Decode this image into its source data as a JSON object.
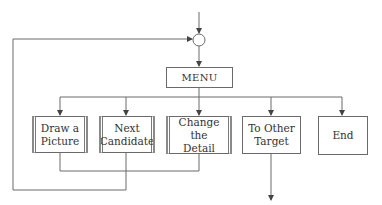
{
  "diagram": {
    "type": "flowchart",
    "nodes": {
      "junction": {
        "shape": "circle"
      },
      "menu": {
        "label": "MENU"
      },
      "draw_picture": {
        "label": "Draw a\nPicture",
        "kind": "subroutine"
      },
      "next_candidate": {
        "label": "Next\nCandidate",
        "kind": "subroutine"
      },
      "change_detail": {
        "label": "Change the\nDetail",
        "kind": "subroutine"
      },
      "to_other_target": {
        "label": "To Other\nTarget",
        "kind": "process"
      },
      "end": {
        "label": "End",
        "kind": "process"
      }
    },
    "edges": [
      {
        "from": "entry",
        "to": "junction"
      },
      {
        "from": "junction",
        "to": "menu"
      },
      {
        "from": "menu",
        "to": "draw_picture"
      },
      {
        "from": "menu",
        "to": "next_candidate"
      },
      {
        "from": "menu",
        "to": "change_detail"
      },
      {
        "from": "menu",
        "to": "to_other_target"
      },
      {
        "from": "menu",
        "to": "end"
      },
      {
        "from": "draw_picture",
        "to": "junction"
      },
      {
        "from": "change_detail",
        "to": "junction"
      },
      {
        "from": "next_candidate",
        "to": "junction"
      },
      {
        "from": "to_other_target",
        "to": "exit"
      }
    ],
    "colors": {
      "line": "#6a6a6a",
      "text": "#333333",
      "background": "#ffffff"
    }
  }
}
